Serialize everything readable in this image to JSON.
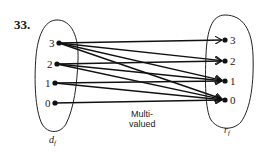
{
  "problem": {
    "number": "33."
  },
  "domain_set": {
    "label": "d",
    "subscript": "f",
    "nodes": [
      {
        "label": "3",
        "x": 59,
        "y": 43
      },
      {
        "label": "2",
        "x": 57,
        "y": 64
      },
      {
        "label": "1",
        "x": 55,
        "y": 83
      },
      {
        "label": "0",
        "x": 55,
        "y": 103
      }
    ]
  },
  "range_set": {
    "label": "r",
    "subscript": "f",
    "nodes": [
      {
        "label": "3",
        "x": 225,
        "y": 40
      },
      {
        "label": "2",
        "x": 225,
        "y": 61
      },
      {
        "label": "1",
        "x": 225,
        "y": 81
      },
      {
        "label": "0",
        "x": 225,
        "y": 100
      }
    ]
  },
  "edges": [
    {
      "from": "3",
      "to": "3"
    },
    {
      "from": "3",
      "to": "2"
    },
    {
      "from": "3",
      "to": "1"
    },
    {
      "from": "3",
      "to": "0"
    },
    {
      "from": "2",
      "to": "2"
    },
    {
      "from": "2",
      "to": "1"
    },
    {
      "from": "2",
      "to": "0"
    },
    {
      "from": "1",
      "to": "1"
    },
    {
      "from": "1",
      "to": "0"
    },
    {
      "from": "0",
      "to": "0"
    }
  ],
  "caption": {
    "line1": "Multi-",
    "line2": "valued"
  },
  "colors": {
    "ink": "#111111",
    "background": "#ffffff"
  }
}
